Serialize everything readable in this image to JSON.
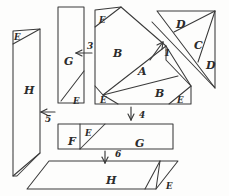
{
  "figure": {
    "ink_color": "#3a3a3a",
    "paper_color": "#fdfdfc",
    "width": 229,
    "height": 196
  },
  "pieces": [
    {
      "id": "p-h-left",
      "label": "H",
      "x": 24,
      "y": 85,
      "size": "big"
    },
    {
      "id": "p-e-hleft",
      "label": "E",
      "x": 14,
      "y": 33,
      "size": "small"
    },
    {
      "id": "p-g-vert",
      "label": "G",
      "x": 64,
      "y": 56,
      "size": "big"
    },
    {
      "id": "p-e-gvert",
      "label": "E",
      "x": 73,
      "y": 97,
      "size": "small"
    },
    {
      "id": "p-e-topleft",
      "label": "E",
      "x": 99,
      "y": 16,
      "size": "small"
    },
    {
      "id": "p-b-upper",
      "label": "B",
      "x": 113,
      "y": 48,
      "size": "big"
    },
    {
      "id": "p-a-mid",
      "label": "A",
      "x": 138,
      "y": 66,
      "size": "big"
    },
    {
      "id": "p-b-lower",
      "label": "B",
      "x": 155,
      "y": 88,
      "size": "big"
    },
    {
      "id": "p-e-botleft",
      "label": "E",
      "x": 100,
      "y": 96,
      "size": "small"
    },
    {
      "id": "p-e-botright",
      "label": "E",
      "x": 177,
      "y": 96,
      "size": "small"
    },
    {
      "id": "p-d-top",
      "label": "D",
      "x": 176,
      "y": 19,
      "size": "big"
    },
    {
      "id": "p-c-top",
      "label": "C",
      "x": 194,
      "y": 40,
      "size": "big"
    },
    {
      "id": "p-d-right",
      "label": "D",
      "x": 206,
      "y": 60,
      "size": "big"
    },
    {
      "id": "p-f-strip",
      "label": "F",
      "x": 68,
      "y": 136,
      "size": "big"
    },
    {
      "id": "p-e-strip",
      "label": "E",
      "x": 85,
      "y": 129,
      "size": "small"
    },
    {
      "id": "p-g-strip",
      "label": "G",
      "x": 135,
      "y": 138,
      "size": "big"
    },
    {
      "id": "p-h-strip",
      "label": "H",
      "x": 106,
      "y": 175,
      "size": "big"
    },
    {
      "id": "p-e-hstrip",
      "label": "E",
      "x": 166,
      "y": 182,
      "size": "small"
    }
  ],
  "step_numbers": [
    {
      "id": "step-1",
      "label": "1",
      "x": 164,
      "y": 49,
      "direction": "up-right"
    },
    {
      "id": "step-3",
      "label": "3",
      "x": 87,
      "y": 47,
      "direction": "left"
    },
    {
      "id": "step-4",
      "label": "4",
      "x": 139,
      "y": 115,
      "direction": "down"
    },
    {
      "id": "step-5",
      "label": "5",
      "x": 45,
      "y": 119,
      "direction": "left"
    },
    {
      "id": "step-6",
      "label": "6",
      "x": 115,
      "y": 154,
      "direction": "down"
    }
  ]
}
